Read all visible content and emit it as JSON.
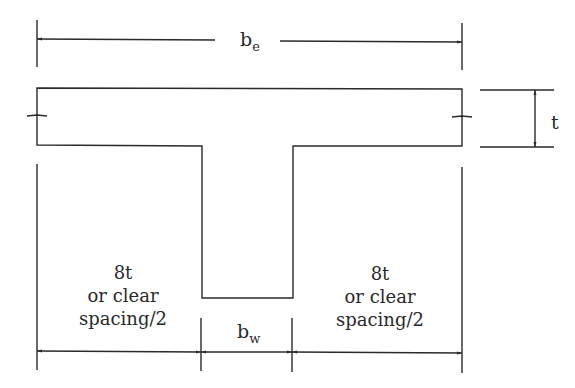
{
  "diagram": {
    "type": "T-beam effective flange width",
    "labels": {
      "effective_width": "b",
      "effective_width_sub": "e",
      "flange_thickness": "t",
      "web_width": "b",
      "web_width_sub": "w",
      "left_overhang_line1": "8t",
      "left_overhang_line2": "or clear",
      "left_overhang_line3": "spacing/2",
      "right_overhang_line1": "8t",
      "right_overhang_line2": "or clear",
      "right_overhang_line3": "spacing/2"
    },
    "colors": {
      "line": "#2a2a2a",
      "background": "#ffffff"
    }
  }
}
